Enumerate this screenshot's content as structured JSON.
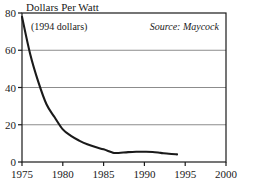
{
  "chart_data": {
    "type": "line",
    "title": "Dollars Per Watt",
    "subtitle": "(1994 dollars)",
    "source_note": "Source: Maycock",
    "xlabel": "",
    "ylabel": "",
    "xlim": [
      1975,
      2000
    ],
    "ylim": [
      0,
      80
    ],
    "xticks": [
      1975,
      1980,
      1985,
      1990,
      1995,
      2000
    ],
    "xtick_labels": [
      "1975",
      "1980",
      "1985",
      "1990",
      "1995",
      "2000"
    ],
    "yticks": [
      0,
      20,
      40,
      60,
      80
    ],
    "ytick_labels": [
      "0",
      "20",
      "40",
      "60",
      "80"
    ],
    "gridlines_y": [
      20,
      40,
      60
    ],
    "grid": true,
    "legend": "none",
    "line_color": "#1a1a1a",
    "grid_color": "#8c8c8c",
    "axis_color": "#1a1a1a",
    "series": [
      {
        "name": "Photovoltaic module price",
        "x": [
          1975,
          1976,
          1977,
          1978,
          1979,
          1980,
          1981,
          1982,
          1983,
          1984,
          1985,
          1986,
          1986.5,
          1988,
          1989,
          1990,
          1991,
          1992,
          1993,
          1994
        ],
        "values": [
          78,
          58,
          43,
          31,
          24,
          17.5,
          14,
          11.5,
          9.5,
          8,
          6.8,
          5.2,
          4.8,
          5.3,
          5.5,
          5.5,
          5.4,
          4.9,
          4.4,
          4.1
        ]
      }
    ]
  },
  "labels": {
    "title": "Dollars Per Watt",
    "subtitle": "(1994 dollars)",
    "source": "Source: Maycock"
  }
}
